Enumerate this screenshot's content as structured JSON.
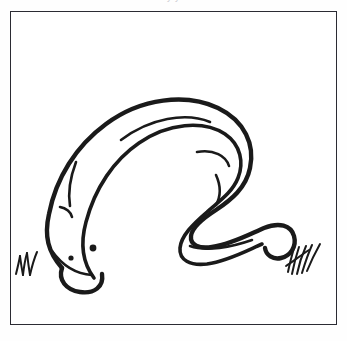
{
  "page": {
    "background_color": "#fefefe",
    "cutoff_header_text": "y                                  y"
  },
  "frame": {
    "border_color": "#2b2b33",
    "fill_color": "#ffffff",
    "border_width_px": 1.6,
    "x": 10,
    "y": 11,
    "width": 327,
    "height": 314
  },
  "illustration": {
    "subject": "snake",
    "style": "black-and-white line art, coloring book outline",
    "stroke_color": "#1a1a1a",
    "fill_color": "#ffffff",
    "description": "A long snake with its head at lower left and tail at lower right, body arching up into a broad hump then curving down in an S-bend",
    "elements": [
      {
        "name": "snake-body-outline",
        "stroke_width": 4.4,
        "path": "M 62 268 C 48 252 44 236 49 214 C 56 178 76 146 106 124 C 141 98 186 93 218 108 C 245 121 255 145 250 168 C 246 188 231 200 216 210 C 202 219 192 228 191 236 C 190 245 199 249 212 247 C 232 244 250 234 264 228 C 279 222 291 225 294 236 C 297 247 290 256 281 258 C 273 260 266 255 265 248"
      },
      {
        "name": "snake-body-inner-edge",
        "stroke_width": 3.6,
        "path": "M 94 278 C 82 262 80 244 86 222 C 95 188 114 160 139 143 C 168 123 203 120 225 134 C 241 145 244 163 238 178 C 232 193 218 202 207 212 C 193 224 181 236 180 248 C 179 260 190 266 207 264 C 228 261 248 250 262 244"
      },
      {
        "name": "snake-highlight-line-upper",
        "stroke_width": 2.6,
        "path": "M 121 140 C 150 118 186 112 210 122"
      },
      {
        "name": "snake-highlight-line-mid",
        "stroke_width": 2.6,
        "path": "M 197 152 C 214 149 226 156 229 166"
      },
      {
        "name": "snake-highlight-line-neck",
        "stroke_width": 2.6,
        "path": "M 76 162 C 70 178 68 194 70 206"
      },
      {
        "name": "snake-highlight-line-bend",
        "stroke_width": 2.6,
        "path": "M 216 175 C 221 186 221 196 216 205"
      },
      {
        "name": "snake-highlight-line-tail",
        "stroke_width": 2.6,
        "path": "M 190 246 C 206 252 232 247 252 240"
      },
      {
        "name": "snake-neck-notch",
        "stroke_width": 2.6,
        "path": "M 60 207 C 66 208 71 212 72 217"
      },
      {
        "name": "snake-head-outline",
        "stroke_width": 4.4,
        "path": "M 62 268 C 58 280 66 290 80 292 C 94 294 104 287 102 274"
      },
      {
        "name": "snake-mouth-line",
        "stroke_width": 2.6,
        "path": "M 52 251 C 62 265 76 274 92 275"
      },
      {
        "name": "snake-eye-dot",
        "shape": "circle",
        "cx": 71,
        "cy": 258,
        "r": 2.6
      },
      {
        "name": "snake-nostril-mark",
        "shape": "circle",
        "cx": 93,
        "cy": 248,
        "r": 3.4
      }
    ],
    "grass": [
      {
        "name": "grass-tuft-left",
        "position": "bottom-left",
        "blade_count": 5,
        "stroke_width": 2.0,
        "x": 16,
        "y": 264
      },
      {
        "name": "grass-tuft-right",
        "position": "bottom-right",
        "blade_count": 6,
        "stroke_width": 2.0,
        "x": 286,
        "y": 266
      }
    ]
  }
}
